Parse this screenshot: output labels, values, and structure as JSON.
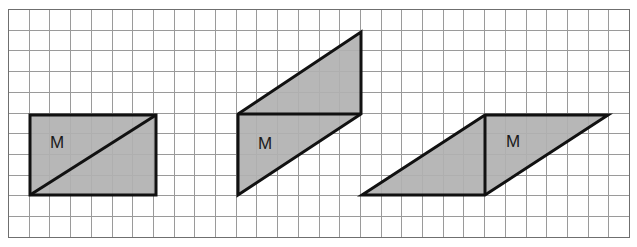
{
  "figure": {
    "canvas": {
      "width": 637,
      "height": 247,
      "background": "#ffffff"
    },
    "grid": {
      "name": "square-grid",
      "x0": 8,
      "y0": 9,
      "cols": 30,
      "rows": 11,
      "cell": 20.7,
      "line_color": "#9a9a9a",
      "border_color": "#6f6f6f",
      "line_width": 1
    },
    "style": {
      "shape_fill": "#b1b1b1",
      "shape_stroke": "#111111",
      "shape_stroke_width": 3,
      "label_color": "#1a1a1a",
      "label_font_size": 17
    },
    "shapes": [
      {
        "id": "shape-1",
        "name": "rectangle-with-diagonal",
        "kind": "rectangle",
        "label": "M",
        "label_x": 57,
        "label_y": 144,
        "outline": "30,195 30,115 156,115 156,195",
        "inner_lines": [
          "30,195 156,115"
        ],
        "grid_units": {
          "width": 6,
          "height": 4
        }
      },
      {
        "id": "shape-2",
        "name": "parallelogram-slanted-tall",
        "kind": "parallelogram",
        "label": "M",
        "label_x": 265,
        "label_y": 145,
        "outline": "238,195 238,114 361,32 361,114",
        "inner_lines": [
          "238,114 361,114"
        ],
        "grid_units": {
          "width": 6,
          "height": 4
        }
      },
      {
        "id": "shape-3",
        "name": "parallelogram-slanted-wide",
        "kind": "parallelogram",
        "label": "M",
        "label_x": 513,
        "label_y": 143,
        "outline": "362,195 485,115 608,115 485,195",
        "inner_lines": [
          "485,115 485,195"
        ],
        "grid_units": {
          "width": 6,
          "height": 4
        }
      }
    ]
  }
}
